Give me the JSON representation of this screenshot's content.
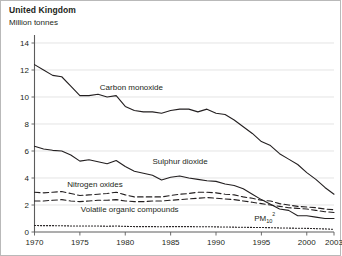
{
  "header": {
    "title": "United Kingdom",
    "subtitle": "Million tonnes"
  },
  "chart_data": {
    "type": "line",
    "title": "United Kingdom",
    "subtitle": "Million tonnes",
    "xlabel": "",
    "ylabel": "Million tonnes",
    "xlim": [
      1970,
      2003
    ],
    "ylim": [
      0,
      14
    ],
    "ytick_labels": [
      "0",
      "2",
      "4",
      "6",
      "8",
      "10",
      "12",
      "14"
    ],
    "yticks": [
      0,
      2,
      4,
      6,
      8,
      10,
      12,
      14
    ],
    "xtick_labels": [
      "1970",
      "1975",
      "1980",
      "1985",
      "1990",
      "1995",
      "2000",
      "2003"
    ],
    "xticks": [
      1970,
      1975,
      1980,
      1985,
      1990,
      1995,
      2000,
      2003
    ],
    "grid": true,
    "legend_position": "inline-labels",
    "x": [
      1970,
      1971,
      1972,
      1973,
      1974,
      1975,
      1976,
      1977,
      1978,
      1979,
      1980,
      1981,
      1982,
      1983,
      1984,
      1985,
      1986,
      1987,
      1988,
      1989,
      1990,
      1991,
      1992,
      1993,
      1994,
      1995,
      1996,
      1997,
      1998,
      1999,
      2000,
      2001,
      2002,
      2003
    ],
    "series": [
      {
        "name": "Carbon monoxide",
        "label": "Carbon monoxide",
        "style": "solid",
        "label_x": 1977.2,
        "label_y": 10.5,
        "values": [
          12.4,
          12.0,
          11.6,
          11.5,
          10.8,
          10.1,
          10.1,
          10.2,
          10.0,
          10.1,
          9.3,
          9.0,
          8.9,
          8.9,
          8.8,
          9.0,
          9.1,
          9.1,
          8.9,
          9.1,
          8.8,
          8.7,
          8.3,
          7.8,
          7.3,
          6.7,
          6.4,
          5.8,
          5.4,
          5.0,
          4.4,
          3.9,
          3.3,
          2.8
        ]
      },
      {
        "name": "Sulphur dioxide",
        "label": "Sulphur dioxide",
        "style": "solid",
        "label_x": 1983.0,
        "label_y": 5.05,
        "values": [
          6.35,
          6.15,
          6.05,
          6.0,
          5.7,
          5.25,
          5.35,
          5.2,
          5.05,
          5.3,
          4.85,
          4.5,
          4.35,
          4.2,
          3.85,
          4.05,
          4.15,
          4.0,
          3.9,
          3.8,
          3.75,
          3.55,
          3.45,
          3.2,
          2.8,
          2.4,
          2.05,
          1.7,
          1.6,
          1.2,
          1.2,
          1.1,
          1.0,
          1.0
        ]
      },
      {
        "name": "Nitrogen oxides",
        "label": "Nitrogen oxides",
        "style": "dashed",
        "label_x": 1973.6,
        "label_y": 3.35,
        "values": [
          2.95,
          2.9,
          2.95,
          3.0,
          2.85,
          2.7,
          2.75,
          2.8,
          2.85,
          2.95,
          2.75,
          2.6,
          2.6,
          2.6,
          2.6,
          2.7,
          2.8,
          2.85,
          2.95,
          2.95,
          2.9,
          2.8,
          2.75,
          2.6,
          2.5,
          2.35,
          2.3,
          2.1,
          2.0,
          1.9,
          1.85,
          1.8,
          1.7,
          1.65
        ]
      },
      {
        "name": "Volatile organic compounds",
        "label": "Volatile organic compounds",
        "style": "dashed",
        "label_x": 1975.1,
        "label_y": 1.45,
        "values": [
          2.3,
          2.3,
          2.35,
          2.4,
          2.3,
          2.25,
          2.3,
          2.35,
          2.35,
          2.4,
          2.3,
          2.25,
          2.25,
          2.3,
          2.3,
          2.35,
          2.4,
          2.45,
          2.5,
          2.55,
          2.5,
          2.45,
          2.4,
          2.3,
          2.2,
          2.1,
          2.0,
          1.9,
          1.8,
          1.75,
          1.7,
          1.6,
          1.5,
          1.45
        ]
      },
      {
        "name": "PM10",
        "label": "PM",
        "label_sub": "10",
        "label_sup": "2",
        "style": "dotted",
        "label_x": 1994.2,
        "label_y": 0.85,
        "values": [
          0.48,
          0.47,
          0.47,
          0.46,
          0.45,
          0.44,
          0.44,
          0.44,
          0.43,
          0.44,
          0.42,
          0.4,
          0.4,
          0.4,
          0.39,
          0.4,
          0.4,
          0.4,
          0.39,
          0.39,
          0.38,
          0.37,
          0.36,
          0.35,
          0.34,
          0.33,
          0.32,
          0.3,
          0.29,
          0.28,
          0.27,
          0.25,
          0.23,
          0.2
        ]
      }
    ]
  }
}
